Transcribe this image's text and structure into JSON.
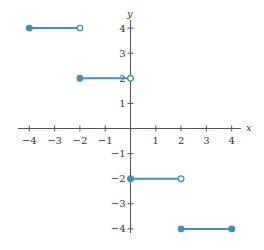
{
  "chart_data": {
    "type": "line",
    "title": "",
    "xlabel": "x",
    "ylabel": "y",
    "xlim": [
      -4,
      4
    ],
    "ylim": [
      -4,
      4
    ],
    "grid": false,
    "x_ticks": [
      -4,
      -3,
      -2,
      -1,
      1,
      2,
      3,
      4
    ],
    "y_ticks": [
      -4,
      -3,
      -2,
      -1,
      1,
      2,
      3,
      4
    ],
    "x_tick_labels": [
      "-4",
      "-3",
      "-2",
      "-1",
      "1",
      "2",
      "3",
      "4"
    ],
    "y_tick_labels": [
      "-4",
      "-3",
      "-2",
      "-1",
      "1",
      "2",
      "3",
      "4"
    ],
    "line_color": "#4a8db0",
    "segments": [
      {
        "x_start": -4,
        "x_end": -2,
        "y": 4,
        "start_closed": true,
        "end_closed": false
      },
      {
        "x_start": -2,
        "x_end": 0,
        "y": 2,
        "start_closed": true,
        "end_closed": false
      },
      {
        "x_start": 0,
        "x_end": 2,
        "y": -2,
        "start_closed": true,
        "end_closed": false
      },
      {
        "x_start": 2,
        "x_end": 4,
        "y": -4,
        "start_closed": true,
        "end_closed": true
      }
    ]
  }
}
